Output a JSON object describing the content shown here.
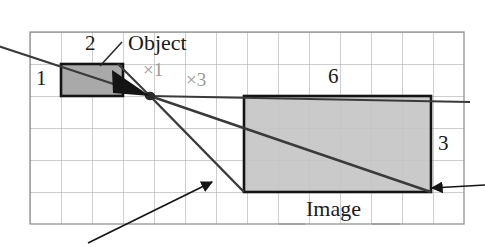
{
  "figure": {
    "grid": {
      "x0": 30,
      "y0": 32,
      "cols": 14,
      "rows": 6,
      "cell_w": 31,
      "cell_h": 32,
      "line_color": "#9a9a9a",
      "border_color": "#6e6e6e"
    },
    "object_rect": {
      "label": "Object",
      "x": 61,
      "y": 64,
      "width": 62,
      "height": 32,
      "fill": "#a9a9a9",
      "stroke": "#1a1a1a"
    },
    "image_rect": {
      "label": "Image",
      "x": 244,
      "y": 96,
      "width": 187,
      "height": 96,
      "fill": "#c2c2c2",
      "stroke": "#1a1a1a"
    },
    "lens_point": {
      "x": 150,
      "y": 96
    },
    "ray_color": "#3a3a3a"
  },
  "labels": {
    "object": "Object",
    "image": "Image",
    "dim_object_height": "1",
    "dim_object_width": "2",
    "dim_image_width": "6",
    "dim_image_height": "3",
    "mag_one": "×1",
    "mag_three": "×3"
  },
  "colors": {
    "object_fill": "#a9a9a9",
    "image_fill": "#c2c2c2",
    "grid_line": "#9a9a9a",
    "ray": "#3a3a3a",
    "text": "#1a1a1a",
    "mag_text": "#9a9a9a"
  }
}
